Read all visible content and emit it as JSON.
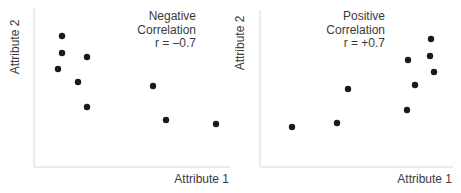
{
  "chart_data": [
    {
      "type": "scatter",
      "title": "Negative Correlation",
      "annotation": [
        "Negative",
        "Correlation",
        "r = –0.7"
      ],
      "r": -0.7,
      "xlabel": "Attribute 1",
      "ylabel": "Attribute 2",
      "grid": false,
      "ticks": false,
      "points_px": [
        [
          62,
          36
        ],
        [
          62,
          53
        ],
        [
          87,
          57
        ],
        [
          58,
          69
        ],
        [
          78,
          82
        ],
        [
          87,
          107
        ],
        [
          153,
          86
        ],
        [
          166,
          120
        ],
        [
          216,
          124
        ]
      ],
      "points": [
        {
          "x": 0.14,
          "y": 0.82
        },
        {
          "x": 0.14,
          "y": 0.71
        },
        {
          "x": 0.27,
          "y": 0.69
        },
        {
          "x": 0.12,
          "y": 0.62
        },
        {
          "x": 0.23,
          "y": 0.54
        },
        {
          "x": 0.27,
          "y": 0.38
        },
        {
          "x": 0.61,
          "y": 0.51
        },
        {
          "x": 0.67,
          "y": 0.3
        },
        {
          "x": 0.93,
          "y": 0.27
        }
      ]
    },
    {
      "type": "scatter",
      "title": "Positive Correlation",
      "annotation": [
        "Positive",
        "Correlation",
        "r = +0.7"
      ],
      "r": 0.7,
      "xlabel": "Attribute 1",
      "ylabel": "Attribute 2",
      "grid": false,
      "ticks": false,
      "points_px": [
        [
          431,
          39
        ],
        [
          430,
          56
        ],
        [
          434,
          72
        ],
        [
          408,
          60
        ],
        [
          415,
          85
        ],
        [
          348,
          89
        ],
        [
          407,
          110
        ],
        [
          337,
          123
        ],
        [
          292,
          127
        ]
      ],
      "points": [
        {
          "x": 0.88,
          "y": 0.8
        },
        {
          "x": 0.88,
          "y": 0.7
        },
        {
          "x": 0.9,
          "y": 0.6
        },
        {
          "x": 0.77,
          "y": 0.67
        },
        {
          "x": 0.8,
          "y": 0.52
        },
        {
          "x": 0.46,
          "y": 0.49
        },
        {
          "x": 0.76,
          "y": 0.36
        },
        {
          "x": 0.4,
          "y": 0.28
        },
        {
          "x": 0.17,
          "y": 0.25
        }
      ]
    }
  ],
  "labels": {
    "left_xlabel": "Attribute 1",
    "left_ylabel": "Attribute 2",
    "left_ann1": "Negative",
    "left_ann2": "Correlation",
    "left_ann3": "r = –0.7",
    "right_xlabel": "Attribute 1",
    "right_ylabel": "Attribute 2",
    "right_ann1": "Positive",
    "right_ann2": "Correlation",
    "right_ann3": "r = +0.7"
  },
  "colors": {
    "axis": "#d8d8d8",
    "point": "#1a1a1a",
    "text": "#3a3a3a"
  }
}
